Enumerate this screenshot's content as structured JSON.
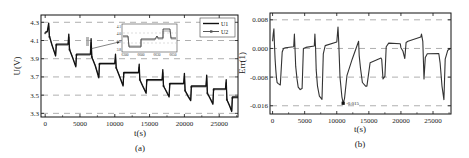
{
  "chart_data": [
    {
      "type": "line",
      "panel_label": "(a)",
      "title": "",
      "xlabel": "t(s)",
      "ylabel": "U(V)",
      "xlim": [
        -600,
        27700
      ],
      "ylim": [
        3.26,
        4.38
      ],
      "xticks": [
        0,
        5000,
        10000,
        15000,
        20000,
        25000
      ],
      "xtick_labels": [
        "0",
        "5000",
        "10000",
        "15000",
        "20000",
        "25000"
      ],
      "yticks": [
        3.3,
        3.5,
        3.7,
        3.9,
        4.1,
        4.3
      ],
      "ytick_labels": [
        "3.3",
        "3.5",
        "3.7",
        "3.9",
        "4.1",
        "4.3"
      ],
      "grid": "dashed horizontal at y ticks",
      "legend": {
        "placement": "top-right",
        "entries": [
          "U1",
          "U2"
        ]
      },
      "series": [
        {
          "name": "U1",
          "x": [
            0,
            300,
            500,
            600,
            1000,
            1500,
            1600,
            3300,
            3400,
            3500,
            3900,
            4400,
            4500,
            6500,
            6600,
            6700,
            7200,
            7700,
            7800,
            10000,
            10100,
            10200,
            10700,
            11200,
            11300,
            13400,
            13500,
            13600,
            14000,
            14500,
            14600,
            16800,
            16900,
            17000,
            17400,
            17800,
            17900,
            19900,
            20000,
            20100,
            20500,
            20900,
            21000,
            23100,
            23200,
            23300,
            23700,
            24100,
            24200,
            25900,
            26000,
            26100,
            26500,
            26800,
            26900,
            27700
          ],
          "y": [
            4.19,
            4.2,
            4.29,
            4.15,
            4.05,
            3.93,
            4.06,
            4.06,
            4.17,
            4.0,
            3.92,
            3.81,
            3.95,
            3.95,
            4.12,
            3.92,
            3.82,
            3.69,
            3.85,
            3.85,
            3.95,
            3.8,
            3.7,
            3.6,
            3.75,
            3.75,
            3.84,
            3.67,
            3.6,
            3.52,
            3.67,
            3.67,
            3.78,
            3.6,
            3.54,
            3.48,
            3.63,
            3.63,
            3.74,
            3.55,
            3.49,
            3.44,
            3.6,
            3.6,
            3.72,
            3.52,
            3.46,
            3.4,
            3.57,
            3.57,
            3.67,
            3.45,
            3.38,
            3.32,
            3.48,
            3.48
          ]
        },
        {
          "name": "U2",
          "x": [
            0,
            300,
            500,
            600,
            1000,
            1500,
            1600,
            3300,
            3400,
            3500,
            3900,
            4400,
            4500,
            6500,
            6600,
            6700,
            7200,
            7700,
            7800,
            10000,
            10100,
            10200,
            10700,
            11200,
            11300,
            13400,
            13500,
            13600,
            14000,
            14500,
            14600,
            16800,
            16900,
            17000,
            17400,
            17800,
            17900,
            19900,
            20000,
            20100,
            20500,
            20900,
            21000,
            23100,
            23200,
            23300,
            23700,
            24100,
            24200,
            25900,
            26000,
            26100,
            26500,
            26800,
            26900,
            27700
          ],
          "y": [
            4.18,
            4.19,
            4.26,
            4.14,
            4.04,
            3.94,
            4.05,
            4.05,
            4.14,
            4.0,
            3.93,
            3.82,
            3.94,
            3.94,
            4.08,
            3.92,
            3.83,
            3.7,
            3.84,
            3.84,
            3.92,
            3.8,
            3.71,
            3.61,
            3.74,
            3.74,
            3.81,
            3.67,
            3.61,
            3.53,
            3.66,
            3.66,
            3.75,
            3.6,
            3.55,
            3.49,
            3.62,
            3.62,
            3.71,
            3.55,
            3.5,
            3.45,
            3.59,
            3.59,
            3.69,
            3.52,
            3.47,
            3.41,
            3.56,
            3.56,
            3.64,
            3.45,
            3.39,
            3.33,
            3.47,
            3.47
          ]
        }
      ],
      "inset": {
        "xtick_labels": [
          "6300",
          "6600",
          "6630",
          "6650"
        ],
        "ytick_labels": [
          "4.1",
          "4.0",
          "3.9",
          "3.8"
        ],
        "note": "zoomed detail of U1/U2 near t≈6600 s, indicated by arrow"
      }
    },
    {
      "type": "line",
      "panel_label": "(b)",
      "title": "",
      "xlabel": "t(s)",
      "ylabel": "Err(1)",
      "xlim": [
        -400,
        27800
      ],
      "ylim": [
        -0.0183,
        0.0099
      ],
      "xticks": [
        0,
        5000,
        10000,
        15000,
        20000,
        25000
      ],
      "xtick_labels": [
        "0",
        "5000",
        "10000",
        "15000",
        "20000",
        "25000"
      ],
      "yticks": [
        0.008,
        0.0,
        -0.008,
        -0.016
      ],
      "ytick_labels": [
        "0.008",
        "0.000",
        "-0.008",
        "-0.016"
      ],
      "grid": "dashed horizontal at y ticks",
      "annotations": [
        {
          "text": "-0.015",
          "x": 11000,
          "y": -0.0153
        }
      ],
      "series": [
        {
          "name": "Err",
          "x": [
            0,
            100,
            200,
            300,
            400,
            500,
            600,
            700,
            900,
            1200,
            1500,
            1700,
            2000,
            3300,
            3400,
            3500,
            3600,
            3800,
            4000,
            4300,
            4600,
            4800,
            5200,
            6500,
            6600,
            6700,
            6800,
            7000,
            7300,
            7700,
            7900,
            8200,
            10000,
            10200,
            10300,
            10500,
            10800,
            11000,
            11200,
            11600,
            12400,
            13400,
            13500,
            13700,
            14000,
            14500,
            14700,
            15200,
            16900,
            17000,
            17200,
            17500,
            17700,
            18100,
            19900,
            20000,
            20300,
            20600,
            20800,
            21100,
            23100,
            23200,
            23400,
            23600,
            23800,
            24100,
            25900,
            26100,
            26400,
            26700,
            26900,
            27300,
            27700
          ],
          "y": [
            0.002,
            0.004,
            0.0055,
            0.001,
            -0.003,
            -0.006,
            -0.008,
            -0.0095,
            -0.0098,
            -0.0102,
            -0.001,
            0.0,
            0.0002,
            0.0005,
            0.004,
            0.0,
            -0.005,
            -0.0085,
            -0.0108,
            -0.0115,
            -0.0112,
            0.0,
            0.0003,
            0.0007,
            0.004,
            0.0,
            -0.006,
            -0.0105,
            -0.0133,
            -0.0142,
            -0.0015,
            0.0008,
            0.0018,
            0.006,
            0.002,
            -0.008,
            -0.0135,
            -0.0153,
            -0.014,
            -0.0075,
            -0.003,
            0.002,
            -0.002,
            -0.0055,
            -0.0095,
            -0.0105,
            -0.0105,
            -0.004,
            -0.0027,
            -0.003,
            -0.0085,
            -0.0078,
            0.0005,
            0.0015,
            0.0013,
            0.0002,
            -0.0007,
            -0.0028,
            0.0017,
            0.002,
            0.0032,
            0.004,
            0.002,
            -0.0085,
            -0.0025,
            -0.0015,
            -0.0014,
            -0.004,
            -0.0105,
            -0.0143,
            -0.003,
            -0.0005,
            0.0
          ]
        }
      ]
    }
  ],
  "legend_a": {
    "entries": [
      "U1",
      "U2"
    ]
  },
  "annotation_b": "-0.015"
}
